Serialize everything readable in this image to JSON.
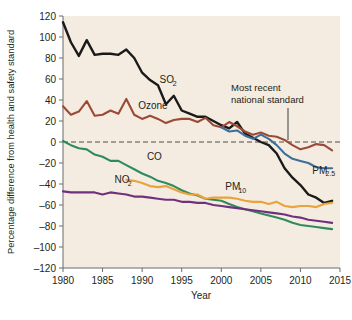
{
  "figure": {
    "background": "#ffffff",
    "plot_background": "#f4ece0"
  },
  "chart_data": {
    "type": "line",
    "title": "",
    "xlabel": "Year",
    "ylabel": "Percentage difference from health and safety standard",
    "xlim": [
      1980,
      2015
    ],
    "ylim": [
      -120,
      120
    ],
    "xticks": [
      1980,
      1985,
      1990,
      1995,
      2000,
      2005,
      2010,
      2015
    ],
    "yticks": [
      120,
      100,
      80,
      60,
      40,
      20,
      0,
      -20,
      -40,
      -60,
      -80,
      -100,
      -120
    ],
    "grid": false,
    "legend": "inline-labels",
    "zero_reference_line": {
      "value": 0,
      "style": "dashed",
      "label": "Most recent national standard",
      "color": "#3b3b3b"
    },
    "annotations": [
      {
        "text_line1": "Most recent",
        "text_line2": "national standard",
        "points_to_year": 2009,
        "points_to_value": 0
      }
    ],
    "x": [
      1980,
      1981,
      1982,
      1983,
      1984,
      1985,
      1986,
      1987,
      1988,
      1989,
      1990,
      1991,
      1992,
      1993,
      1994,
      1995,
      1996,
      1997,
      1998,
      1999,
      2000,
      2001,
      2002,
      2003,
      2004,
      2005,
      2006,
      2007,
      2008,
      2009,
      2010,
      2011,
      2012,
      2013,
      2014
    ],
    "series": [
      {
        "name": "SO2",
        "label": "SO",
        "label_sub": "2",
        "color": "#1a1a1a",
        "label_year": 1992.2,
        "label_value": 56,
        "values": [
          114,
          95,
          82,
          97,
          83,
          84,
          84,
          83,
          88,
          80,
          66,
          59,
          54,
          36,
          44,
          30,
          27,
          24,
          24,
          20,
          16,
          13,
          19,
          8,
          4,
          0,
          -3,
          -11,
          -25,
          -34,
          -41,
          -50,
          -53,
          -58,
          -56
        ]
      },
      {
        "name": "Ozone",
        "label": "Ozone",
        "label_sub": "",
        "color": "#9c4a38",
        "label_year": 1989.5,
        "label_value": 31,
        "values": [
          34,
          26,
          29,
          39,
          25,
          26,
          30,
          27,
          41,
          26,
          22,
          25,
          22,
          18,
          21,
          22,
          22,
          19,
          23,
          16,
          14,
          19,
          15,
          10,
          7,
          9,
          6,
          5,
          2,
          -3,
          -7,
          -5,
          -2,
          -3,
          -8
        ]
      },
      {
        "name": "CO",
        "label": "CO",
        "label_sub": "",
        "color": "#2f8b5c",
        "label_year": 1990.6,
        "label_value": -17,
        "values": [
          1,
          -3,
          -6,
          -7,
          -12,
          -14,
          -18,
          -18,
          -22,
          -26,
          -30,
          -33,
          -37,
          -39,
          -42,
          -46,
          -49,
          -51,
          -54,
          -55,
          -56,
          -59,
          -62,
          -64,
          -66,
          -68,
          -70,
          -72,
          -74,
          -77,
          -79,
          -80,
          -81,
          -82,
          -83
        ]
      },
      {
        "name": "NO2",
        "label": "NO",
        "label_sub": "2",
        "color": "#70307d",
        "label_year": 1986.5,
        "label_value": -39,
        "values": [
          -47,
          -48,
          -48,
          -48,
          -48,
          -50,
          -48,
          -49,
          -50,
          -52,
          -52,
          -53,
          -54,
          -55,
          -55,
          -57,
          -57,
          -58,
          -58,
          -60,
          -61,
          -62,
          -63,
          -64,
          -65,
          -66,
          -67,
          -68,
          -69,
          -71,
          -72,
          -74,
          -75,
          -76,
          -77
        ]
      },
      {
        "name": "PM10",
        "label": "PM",
        "label_sub": "10",
        "color": "#e8a33d",
        "label_year": 2000.5,
        "label_value": -46,
        "start_year": 1988,
        "values": [
          null,
          null,
          null,
          null,
          null,
          null,
          null,
          null,
          -36,
          -37,
          -39,
          -42,
          -43,
          -42,
          -45,
          -48,
          -50,
          -50,
          -54,
          -53,
          -53,
          -53,
          -54,
          -56,
          -57,
          -57,
          -59,
          -57,
          -61,
          -62,
          -61,
          -61,
          -62,
          -59,
          -58
        ]
      },
      {
        "name": "PM2.5",
        "label": "PM",
        "label_sub": "2.5",
        "color": "#3f6e99",
        "label_year": 2011.5,
        "label_value": -30,
        "start_year": 2000,
        "values": [
          null,
          null,
          null,
          null,
          null,
          null,
          null,
          null,
          null,
          null,
          null,
          null,
          null,
          null,
          null,
          null,
          null,
          null,
          null,
          null,
          14,
          10,
          11,
          6,
          3,
          7,
          3,
          -3,
          -11,
          -16,
          -18,
          -20,
          -24,
          -25,
          -25
        ]
      }
    ]
  }
}
